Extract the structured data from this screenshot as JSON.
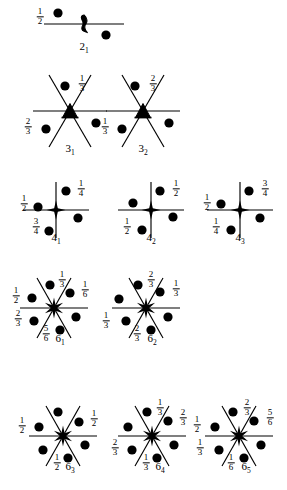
{
  "figure": {
    "background_color": "#ffffff",
    "ink_color": "#000000"
  },
  "axes": [
    {
      "id": "2_1",
      "symbol": "2",
      "order_subscript": "1",
      "caption": "2",
      "center": [
        84,
        24
      ],
      "caption_pos": [
        84,
        40
      ],
      "center_glyph": "lens-with-tails",
      "lines": [
        {
          "x1": -40,
          "y1": 0,
          "x2": 40,
          "y2": 0
        }
      ],
      "dots": [
        {
          "x": -26,
          "y": -11
        },
        {
          "x": 22,
          "y": 11
        }
      ],
      "labels": [
        {
          "num": "1",
          "den": "2",
          "x": -44,
          "y": -7
        }
      ]
    },
    {
      "id": "3_1",
      "symbol": "3",
      "order_subscript": "1",
      "caption": "3",
      "center": [
        70,
        111
      ],
      "caption_pos": [
        70,
        142
      ],
      "center_glyph": "triangle-with-tails",
      "lines": [
        {
          "x1": -37,
          "y1": 0,
          "x2": 37,
          "y2": 0
        },
        {
          "x1": -21,
          "y1": -36,
          "x2": 21,
          "y2": 36
        },
        {
          "x1": 21,
          "y1": -36,
          "x2": -21,
          "y2": 36
        }
      ],
      "dots": [
        {
          "x": -5,
          "y": -25
        },
        {
          "x": -24,
          "y": 18
        },
        {
          "x": 26,
          "y": 12
        }
      ],
      "labels": [
        {
          "num": "1",
          "den": "3",
          "x": 12,
          "y": -27
        },
        {
          "num": "2",
          "den": "3",
          "x": -42,
          "y": 16
        }
      ]
    },
    {
      "id": "3_2",
      "symbol": "3",
      "order_subscript": "2",
      "caption": "3",
      "center": [
        143,
        111
      ],
      "caption_pos": [
        143,
        142
      ],
      "center_glyph": "triangle-with-tails",
      "lines": [
        {
          "x1": -37,
          "y1": 0,
          "x2": 37,
          "y2": 0
        },
        {
          "x1": -21,
          "y1": -36,
          "x2": 21,
          "y2": 36
        },
        {
          "x1": 21,
          "y1": -36,
          "x2": -21,
          "y2": 36
        }
      ],
      "dots": [
        {
          "x": -8,
          "y": -25
        },
        {
          "x": -21,
          "y": 18
        },
        {
          "x": 26,
          "y": 12
        }
      ],
      "labels": [
        {
          "num": "2",
          "den": "3",
          "x": 10,
          "y": -27
        },
        {
          "num": "1",
          "den": "3",
          "x": -38,
          "y": 16
        }
      ]
    },
    {
      "id": "4_1",
      "symbol": "4",
      "order_subscript": "1",
      "caption": "4",
      "center": [
        56,
        210
      ],
      "caption_pos": [
        56,
        231
      ],
      "center_glyph": "square-star",
      "lines": [
        {
          "x1": -33,
          "y1": 0,
          "x2": 33,
          "y2": 0
        },
        {
          "x1": 0,
          "y1": -28,
          "x2": 0,
          "y2": 28
        }
      ],
      "dots": [
        {
          "x": 10,
          "y": -19
        },
        {
          "x": -18,
          "y": -3
        },
        {
          "x": 22,
          "y": 8
        },
        {
          "x": -7,
          "y": 21
        }
      ],
      "labels": [
        {
          "num": "1",
          "den": "4",
          "x": 25,
          "y": -21
        },
        {
          "num": "1",
          "den": "2",
          "x": -32,
          "y": -6
        },
        {
          "num": "3",
          "den": "4",
          "x": -20,
          "y": 17
        }
      ]
    },
    {
      "id": "4_2",
      "symbol": "4",
      "order_subscript": "2",
      "caption": "4",
      "center": [
        151,
        210
      ],
      "caption_pos": [
        151,
        231
      ],
      "center_glyph": "square-star",
      "lines": [
        {
          "x1": -33,
          "y1": 0,
          "x2": 33,
          "y2": 0
        },
        {
          "x1": 0,
          "y1": -28,
          "x2": 0,
          "y2": 28
        }
      ],
      "dots": [
        {
          "x": 9,
          "y": -19
        },
        {
          "x": -18,
          "y": -7
        },
        {
          "x": 22,
          "y": 7
        },
        {
          "x": -9,
          "y": 20
        }
      ],
      "labels": [
        {
          "num": "1",
          "den": "2",
          "x": 25,
          "y": -21
        },
        {
          "num": "1",
          "den": "2",
          "x": -24,
          "y": 17
        }
      ]
    },
    {
      "id": "4_3",
      "symbol": "4",
      "order_subscript": "3",
      "caption": "4",
      "center": [
        240,
        210
      ],
      "caption_pos": [
        240,
        231
      ],
      "center_glyph": "square-star",
      "lines": [
        {
          "x1": -33,
          "y1": 0,
          "x2": 33,
          "y2": 0
        },
        {
          "x1": 0,
          "y1": -28,
          "x2": 0,
          "y2": 28
        }
      ],
      "dots": [
        {
          "x": 9,
          "y": -19
        },
        {
          "x": -19,
          "y": -6
        },
        {
          "x": 20,
          "y": 8
        },
        {
          "x": -9,
          "y": 20
        }
      ],
      "labels": [
        {
          "num": "3",
          "den": "4",
          "x": 25,
          "y": -21
        },
        {
          "num": "1",
          "den": "2",
          "x": -33,
          "y": -7
        },
        {
          "num": "1",
          "den": "4",
          "x": -24,
          "y": 17
        }
      ]
    },
    {
      "id": "6_1",
      "symbol": "6",
      "order_subscript": "1",
      "caption": "6",
      "center": [
        54,
        308
      ],
      "caption_pos": [
        60,
        332
      ],
      "center_glyph": "hex-star",
      "lines": [
        {
          "x1": -34,
          "y1": 0,
          "x2": 34,
          "y2": 0
        },
        {
          "x1": -17,
          "y1": -30,
          "x2": 17,
          "y2": 30
        },
        {
          "x1": 17,
          "y1": -30,
          "x2": -17,
          "y2": 30
        }
      ],
      "dots": [
        {
          "x": -4,
          "y": -23
        },
        {
          "x": 16,
          "y": -15
        },
        {
          "x": -22,
          "y": -10
        },
        {
          "x": 22,
          "y": 9
        },
        {
          "x": -20,
          "y": 13
        },
        {
          "x": 6,
          "y": 22
        }
      ],
      "labels": [
        {
          "num": "1",
          "den": "3",
          "x": 8,
          "y": -28
        },
        {
          "num": "1",
          "den": "6",
          "x": 31,
          "y": -18
        },
        {
          "num": "1",
          "den": "2",
          "x": -38,
          "y": -12
        },
        {
          "num": "2",
          "den": "3",
          "x": -36,
          "y": 11
        },
        {
          "num": "5",
          "den": "6",
          "x": -8,
          "y": 26
        }
      ]
    },
    {
      "id": "6_2",
      "symbol": "6",
      "order_subscript": "2",
      "caption": "6",
      "center": [
        146,
        308
      ],
      "caption_pos": [
        152,
        332
      ],
      "center_glyph": "hex-star",
      "lines": [
        {
          "x1": -34,
          "y1": 0,
          "x2": 34,
          "y2": 0
        },
        {
          "x1": -17,
          "y1": -30,
          "x2": 17,
          "y2": 30
        },
        {
          "x1": 17,
          "y1": -30,
          "x2": -17,
          "y2": 30
        }
      ],
      "dots": [
        {
          "x": -8,
          "y": -23
        },
        {
          "x": 14,
          "y": -16
        },
        {
          "x": -27,
          "y": -9
        },
        {
          "x": 22,
          "y": 9
        },
        {
          "x": -20,
          "y": 13
        },
        {
          "x": 5,
          "y": 22
        }
      ],
      "labels": [
        {
          "num": "2",
          "den": "3",
          "x": 5,
          "y": -28
        },
        {
          "num": "1",
          "den": "3",
          "x": 30,
          "y": -19
        },
        {
          "num": "1",
          "den": "3",
          "x": -40,
          "y": 13
        },
        {
          "num": "2",
          "den": "3",
          "x": -9,
          "y": 26
        }
      ]
    },
    {
      "id": "6_3",
      "symbol": "6",
      "order_subscript": "3",
      "caption": "6",
      "center": [
        63,
        436
      ],
      "caption_pos": [
        70,
        460
      ],
      "center_glyph": "hex-star",
      "lines": [
        {
          "x1": -34,
          "y1": 0,
          "x2": 34,
          "y2": 0
        },
        {
          "x1": -17,
          "y1": -30,
          "x2": 17,
          "y2": 30
        },
        {
          "x1": 17,
          "y1": -30,
          "x2": -17,
          "y2": 30
        }
      ],
      "dots": [
        {
          "x": -5,
          "y": -24
        },
        {
          "x": 16,
          "y": -14
        },
        {
          "x": -24,
          "y": -9
        },
        {
          "x": 22,
          "y": 9
        },
        {
          "x": -20,
          "y": 14
        },
        {
          "x": 5,
          "y": 22
        }
      ],
      "labels": [
        {
          "num": "1",
          "den": "2",
          "x": 31,
          "y": -17
        },
        {
          "num": "1",
          "den": "2",
          "x": -41,
          "y": -10
        },
        {
          "num": "1",
          "den": "2",
          "x": -6,
          "y": 27
        }
      ]
    },
    {
      "id": "6_4",
      "symbol": "6",
      "order_subscript": "4",
      "caption": "6",
      "center": [
        152,
        436
      ],
      "caption_pos": [
        160,
        460
      ],
      "center_glyph": "hex-star",
      "lines": [
        {
          "x1": -34,
          "y1": 0,
          "x2": 34,
          "y2": 0
        },
        {
          "x1": -17,
          "y1": -30,
          "x2": 17,
          "y2": 30
        },
        {
          "x1": 17,
          "y1": -30,
          "x2": -17,
          "y2": 30
        }
      ],
      "dots": [
        {
          "x": -5,
          "y": -24
        },
        {
          "x": 16,
          "y": -15
        },
        {
          "x": -24,
          "y": -9
        },
        {
          "x": 22,
          "y": 9
        },
        {
          "x": -20,
          "y": 14
        },
        {
          "x": 5,
          "y": 22
        }
      ],
      "labels": [
        {
          "num": "1",
          "den": "3",
          "x": 8,
          "y": -28
        },
        {
          "num": "2",
          "den": "3",
          "x": 31,
          "y": -18
        },
        {
          "num": "2",
          "den": "3",
          "x": -37,
          "y": 12
        },
        {
          "num": "1",
          "den": "3",
          "x": -6,
          "y": 27
        }
      ]
    },
    {
      "id": "6_5",
      "symbol": "6",
      "order_subscript": "5",
      "caption": "6",
      "center": [
        239,
        436
      ],
      "caption_pos": [
        246,
        460
      ],
      "center_glyph": "hex-star",
      "lines": [
        {
          "x1": -34,
          "y1": 0,
          "x2": 34,
          "y2": 0
        },
        {
          "x1": -17,
          "y1": -30,
          "x2": 17,
          "y2": 30
        },
        {
          "x1": 17,
          "y1": -30,
          "x2": -17,
          "y2": 30
        }
      ],
      "dots": [
        {
          "x": -6,
          "y": -24
        },
        {
          "x": 15,
          "y": -15
        },
        {
          "x": -24,
          "y": -9
        },
        {
          "x": 22,
          "y": 9
        },
        {
          "x": -20,
          "y": 14
        },
        {
          "x": 5,
          "y": 22
        }
      ],
      "labels": [
        {
          "num": "2",
          "den": "3",
          "x": 8,
          "y": -28
        },
        {
          "num": "5",
          "den": "6",
          "x": 31,
          "y": -18
        },
        {
          "num": "1",
          "den": "2",
          "x": -42,
          "y": -11
        },
        {
          "num": "1",
          "den": "3",
          "x": -39,
          "y": 12
        },
        {
          "num": "1",
          "den": "6",
          "x": -8,
          "y": 27
        }
      ]
    }
  ]
}
